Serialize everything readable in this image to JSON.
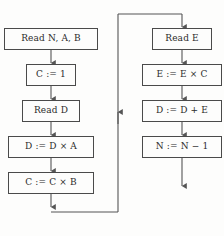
{
  "diagram": {
    "type": "flowchart",
    "title": "",
    "colors": {
      "background": "#fdfdfc",
      "box_border": "#4a4a4a",
      "text": "#2b2b2b",
      "connector": "#555555"
    },
    "nodes": [
      {
        "id": "read-n-a-b",
        "label": "Read N, A, B",
        "column": "left",
        "x": 4,
        "y": 28,
        "w": 94,
        "h": 22
      },
      {
        "id": "c-assign-1",
        "label": "C := 1",
        "column": "left",
        "x": 26,
        "y": 64,
        "w": 50,
        "h": 22
      },
      {
        "id": "read-d",
        "label": "Read D",
        "column": "left",
        "x": 22,
        "y": 100,
        "w": 58,
        "h": 22
      },
      {
        "id": "d-assign-da",
        "label": "D := D × A",
        "column": "left",
        "x": 8,
        "y": 136,
        "w": 86,
        "h": 22
      },
      {
        "id": "c-assign-cb",
        "label": "C := C × B",
        "column": "left",
        "x": 8,
        "y": 172,
        "w": 86,
        "h": 22
      },
      {
        "id": "read-e",
        "label": "Read E",
        "column": "right",
        "x": 152,
        "y": 28,
        "w": 60,
        "h": 22
      },
      {
        "id": "e-assign-ec",
        "label": "E := E × C",
        "column": "right",
        "x": 142,
        "y": 64,
        "w": 80,
        "h": 22
      },
      {
        "id": "d-assign-de",
        "label": "D := D + E",
        "column": "right",
        "x": 142,
        "y": 100,
        "w": 80,
        "h": 22
      },
      {
        "id": "n-assign-n1",
        "label": "N := N − 1",
        "column": "right",
        "x": 142,
        "y": 136,
        "w": 80,
        "h": 22
      }
    ],
    "connectors": [
      {
        "id": "read-n-a-b-to-c-assign-1",
        "from": "read-n-a-b",
        "to": "c-assign-1",
        "arrow": "down"
      },
      {
        "id": "c-assign-1-to-read-d",
        "from": "c-assign-1",
        "to": "read-d",
        "arrow": "down"
      },
      {
        "id": "read-d-to-d-assign-da",
        "from": "read-d",
        "to": "d-assign-da",
        "arrow": "down"
      },
      {
        "id": "d-assign-da-to-c-assign-cb",
        "from": "d-assign-da",
        "to": "c-assign-cb",
        "arrow": "down"
      },
      {
        "id": "c-assign-cb-to-loop",
        "from": "c-assign-cb",
        "to": "loop-riser",
        "arrow": "down"
      },
      {
        "id": "loop-riser-to-read-e",
        "from": "loop-riser",
        "to": "read-e",
        "arrow": "up-then-right-then-down"
      },
      {
        "id": "read-e-to-e-assign-ec",
        "from": "read-e",
        "to": "e-assign-ec",
        "arrow": "down"
      },
      {
        "id": "e-assign-ec-to-d-assign-de",
        "from": "e-assign-ec",
        "to": "d-assign-de",
        "arrow": "down"
      },
      {
        "id": "d-assign-de-to-n-assign-n1",
        "from": "d-assign-de",
        "to": "n-assign-n1",
        "arrow": "down"
      },
      {
        "id": "n-assign-n1-exit",
        "from": "n-assign-n1",
        "to": "exit",
        "arrow": "down"
      }
    ]
  }
}
